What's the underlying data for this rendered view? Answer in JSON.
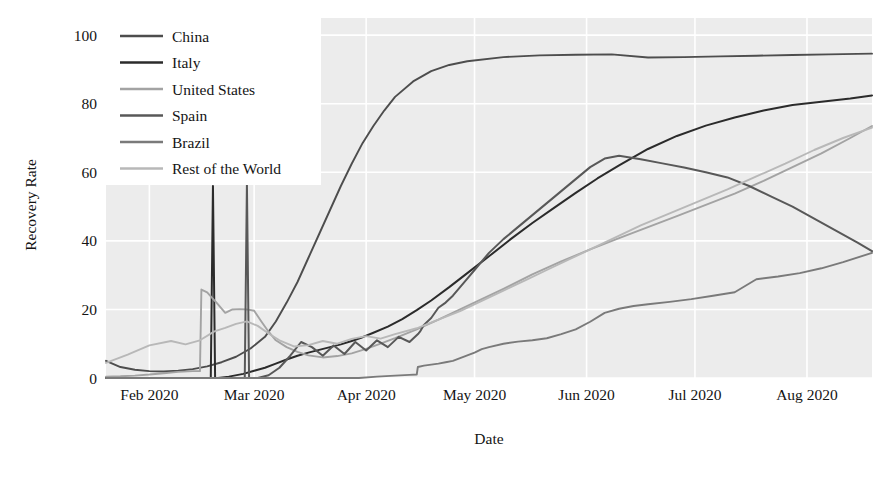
{
  "chart_data": {
    "type": "line",
    "title": "",
    "xlabel": "Date",
    "ylabel": "Recovery Rate",
    "grid": true,
    "legend_position": "upper-left",
    "ylim": [
      0,
      105
    ],
    "yticks": [
      0,
      20,
      40,
      60,
      80,
      100
    ],
    "ytick_labels": [
      "0",
      "20",
      "40",
      "60",
      "80",
      "100"
    ],
    "xlim": [
      0,
      212
    ],
    "xticks": [
      12,
      41,
      72,
      102,
      133,
      163,
      194
    ],
    "xtick_labels": [
      "Feb 2020",
      "Mar 2020",
      "Apr 2020",
      "May 2020",
      "Jun 2020",
      "Jul 2020",
      "Aug 2020"
    ],
    "x_unit": "days since 2020-01-22",
    "series": [
      {
        "name": "China",
        "color": "#4d4d4d",
        "width": 1.9,
        "x": [
          0,
          4,
          8,
          12,
          16,
          20,
          24,
          28,
          32,
          36,
          40,
          44,
          47,
          50,
          53,
          56,
          59,
          62,
          65,
          68,
          71,
          74,
          77,
          80,
          85,
          90,
          95,
          100,
          110,
          120,
          130,
          140,
          150,
          160,
          170,
          180,
          190,
          200,
          212
        ],
        "y": [
          5.0,
          3.2,
          2.4,
          2.0,
          1.9,
          2.1,
          2.6,
          3.4,
          4.6,
          6.2,
          8.6,
          12.0,
          16.5,
          22.0,
          28.0,
          35.0,
          42.0,
          49.0,
          56.0,
          62.5,
          68.5,
          73.5,
          78.0,
          82.0,
          86.5,
          89.5,
          91.3,
          92.4,
          93.6,
          94.1,
          94.3,
          94.4,
          93.5,
          93.6,
          93.8,
          94.0,
          94.2,
          94.4,
          94.6
        ]
      },
      {
        "name": "Italy",
        "color": "#2b2b2b",
        "width": 2.0,
        "x": [
          0,
          10,
          20,
          26,
          29,
          29.6,
          30.2,
          31,
          34,
          38,
          41,
          44,
          47,
          50,
          53,
          56,
          59,
          62,
          65,
          68,
          71,
          74,
          78,
          82,
          86,
          90,
          95,
          100,
          106,
          112,
          118,
          124,
          130,
          136,
          142,
          150,
          158,
          166,
          174,
          182,
          190,
          198,
          206,
          212
        ],
        "y": [
          0,
          0,
          0,
          0,
          0,
          56.0,
          0,
          0,
          0.4,
          1.2,
          2.1,
          3.0,
          4.2,
          5.4,
          6.5,
          7.4,
          8.2,
          9.0,
          9.8,
          10.8,
          11.9,
          13.2,
          15.0,
          17.2,
          19.8,
          22.6,
          26.5,
          30.6,
          35.5,
          40.5,
          45.2,
          49.6,
          54.0,
          58.2,
          62.0,
          66.8,
          70.6,
          73.6,
          76.0,
          78.0,
          79.6,
          80.6,
          81.5,
          82.4
        ]
      },
      {
        "name": "United States",
        "color": "#a3a3a3",
        "width": 1.9,
        "x": [
          0,
          4,
          8,
          12,
          16,
          20,
          24,
          26,
          26.4,
          28,
          31,
          33,
          35,
          37,
          39,
          41,
          43,
          45,
          47,
          50,
          53,
          56,
          60,
          64,
          68,
          72,
          76,
          80,
          86,
          92,
          98,
          104,
          110,
          118,
          126,
          134,
          142,
          150,
          158,
          166,
          174,
          182,
          190,
          198,
          206,
          212
        ],
        "y": [
          0.4,
          0.5,
          0.7,
          1.0,
          1.4,
          1.8,
          2.0,
          2.0,
          25.8,
          25.0,
          21.5,
          19.0,
          20.0,
          20.1,
          20.0,
          19.6,
          16.5,
          13.5,
          11.0,
          9.0,
          7.6,
          6.6,
          6.0,
          6.4,
          7.2,
          8.5,
          10.0,
          11.6,
          14.2,
          17.0,
          20.0,
          23.0,
          26.0,
          30.2,
          34.0,
          37.5,
          40.8,
          44.0,
          47.2,
          50.5,
          53.8,
          57.5,
          61.5,
          65.5,
          70.0,
          73.5
        ]
      },
      {
        "name": "Spain",
        "color": "#585858",
        "width": 2.0,
        "x": [
          0,
          20,
          30,
          36,
          38.4,
          39,
          39.6,
          42,
          45,
          48,
          51,
          54,
          57,
          60,
          63,
          66,
          69,
          72,
          75,
          78,
          81,
          84,
          86.5,
          86.9,
          88,
          90,
          92,
          94,
          96,
          98,
          100,
          102,
          104,
          106,
          110,
          114,
          118,
          122,
          126,
          130,
          134,
          138,
          142,
          148,
          154,
          160,
          166,
          172,
          178,
          184,
          190,
          196,
          202,
          208,
          212
        ],
        "y": [
          0,
          0,
          0,
          0,
          0,
          56.5,
          0,
          0,
          0.8,
          3.0,
          6.5,
          10.5,
          9.0,
          6.5,
          9.5,
          7.0,
          10.5,
          8.0,
          11.0,
          9.0,
          12.0,
          10.5,
          13.0,
          13.5,
          15.5,
          17.5,
          20.5,
          22.0,
          24.0,
          26.5,
          29.0,
          31.5,
          34.0,
          36.5,
          40.5,
          44.0,
          47.5,
          51.0,
          54.5,
          58.0,
          61.5,
          64.0,
          64.8,
          63.8,
          62.6,
          61.4,
          60.0,
          58.5,
          56.0,
          53.0,
          50.0,
          46.5,
          43.0,
          39.5,
          37.0
        ]
      },
      {
        "name": "Brazil",
        "color": "#7a7a7a",
        "width": 1.9,
        "x": [
          0,
          40,
          60,
          70,
          75,
          80,
          84,
          86,
          86.3,
          88,
          90,
          92,
          94,
          96,
          98,
          100,
          102,
          104,
          106,
          110,
          114,
          118,
          122,
          126,
          130,
          134,
          138,
          142,
          146,
          150,
          156,
          162,
          168,
          174,
          180,
          186,
          192,
          198,
          204,
          212
        ],
        "y": [
          0,
          0,
          0,
          0,
          0.4,
          0.7,
          0.9,
          1.0,
          3.2,
          3.6,
          3.9,
          4.2,
          4.6,
          5.0,
          5.8,
          6.6,
          7.4,
          8.4,
          9.0,
          10.0,
          10.6,
          11.0,
          11.6,
          12.8,
          14.2,
          16.4,
          19.0,
          20.2,
          21.0,
          21.5,
          22.2,
          23.0,
          24.0,
          25.0,
          28.8,
          29.6,
          30.6,
          32.0,
          33.8,
          36.5
        ]
      },
      {
        "name": "Rest of the World",
        "color": "#b8b8b8",
        "width": 1.9,
        "x": [
          0,
          6,
          12,
          18,
          22,
          26,
          30,
          33,
          36,
          39,
          42,
          45,
          48,
          52,
          56,
          60,
          64,
          68,
          72,
          76,
          80,
          86,
          92,
          98,
          104,
          110,
          116,
          122,
          128,
          134,
          140,
          148,
          156,
          164,
          172,
          180,
          188,
          196,
          204,
          212
        ],
        "y": [
          4.4,
          6.8,
          9.5,
          10.8,
          9.8,
          11.0,
          13.6,
          14.6,
          15.8,
          16.5,
          15.2,
          13.0,
          11.0,
          9.2,
          9.6,
          10.8,
          10.0,
          11.4,
          12.2,
          11.5,
          12.8,
          14.5,
          17.0,
          19.5,
          22.5,
          25.5,
          28.5,
          31.5,
          34.5,
          37.5,
          40.5,
          44.5,
          48.0,
          51.5,
          55.0,
          58.8,
          62.5,
          66.5,
          70.0,
          73.0
        ]
      }
    ]
  },
  "legend": {
    "entries": [
      {
        "label": "China"
      },
      {
        "label": "Italy"
      },
      {
        "label": "United States"
      },
      {
        "label": "Spain"
      },
      {
        "label": "Brazil"
      },
      {
        "label": "Rest of the World"
      }
    ]
  },
  "colors": {
    "plot_background": "#ececec",
    "grid": "#ffffff",
    "page_background": "#ffffff",
    "text": "#141414"
  }
}
